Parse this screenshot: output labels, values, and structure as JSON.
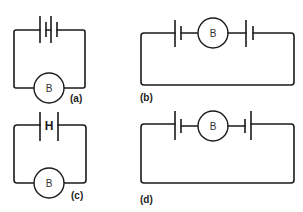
{
  "figure": {
    "panels": [
      {
        "id": "a",
        "label": "(a)",
        "bulb_label": "B",
        "description": "Two cells in series with bulb"
      },
      {
        "id": "b",
        "label": "(b)",
        "bulb_label": "B",
        "description": "Bulb between two cells facing opposite"
      },
      {
        "id": "c",
        "label": "(c)",
        "bulb_label": "B",
        "description": "Single cell with H symbol and bulb"
      },
      {
        "id": "d",
        "label": "(d)",
        "bulb_label": "B",
        "description": "Bulb between two cells"
      }
    ],
    "colors": {
      "line": "#1a1a1a",
      "background": "#ffffff"
    },
    "h_symbol": "H"
  }
}
